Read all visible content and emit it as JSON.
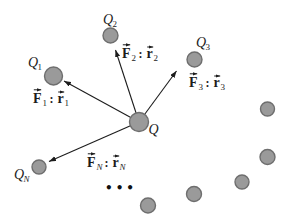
{
  "colors": {
    "background": "#ffffff",
    "charge_fill": "#9a9a9a",
    "charge_stroke": "#6e6e6e",
    "arrow": "#1c1c1c",
    "text": "#1c1c1c"
  },
  "diagram": {
    "description_type": "point-charge force diagram",
    "central_charge": {
      "symbol": "Q"
    },
    "charges": [
      {
        "symbol": "Q",
        "sub": "1",
        "force": {
          "f": "F",
          "f_sub": "1",
          "sep": ":",
          "r": "r",
          "r_sub": "1"
        }
      },
      {
        "symbol": "Q",
        "sub": "2",
        "force": {
          "f": "F",
          "f_sub": "2",
          "sep": ":",
          "r": "r",
          "r_sub": "2"
        }
      },
      {
        "symbol": "Q",
        "sub": "3",
        "force": {
          "f": "F",
          "f_sub": "3",
          "sep": ":",
          "r": "r",
          "r_sub": "3"
        }
      },
      {
        "symbol": "Q",
        "sub": "N",
        "force": {
          "f": "F",
          "f_sub": "N",
          "sep": ":",
          "r": "r",
          "r_sub": "N"
        }
      }
    ],
    "ellipsis": "•••",
    "unlabeled_charge_count": 5
  }
}
